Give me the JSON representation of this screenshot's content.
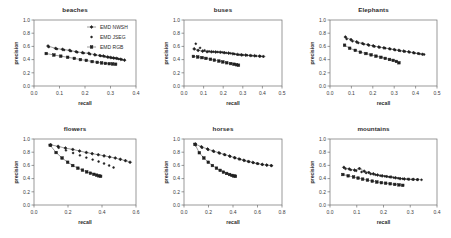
{
  "figure": {
    "layout": "2x3 grid of precision-recall plots",
    "rows": 2,
    "cols": 3,
    "axis_titles": {
      "x": "recall",
      "y": "precision"
    },
    "series_styles": [
      {
        "name": "EMD NWSH",
        "marker": "diamond",
        "line": true,
        "color": "#1f1f1f"
      },
      {
        "name": "EMD JSEG",
        "marker": "dot",
        "line": false,
        "color": "#1f1f1f"
      },
      {
        "name": "EMD RGB",
        "marker": "square",
        "line": true,
        "color": "#1f1f1f"
      }
    ],
    "legend": {
      "position": "top-right of first panel",
      "entries": [
        "EMD NWSH",
        "EMD JSEG",
        "EMD RGB"
      ]
    }
  },
  "chart_data": [
    {
      "type": "scatter",
      "title": "beaches",
      "xlabel": "recall",
      "ylabel": "precision",
      "xlim": [
        0.0,
        0.4
      ],
      "ylim": [
        0.0,
        1.0
      ],
      "xticks": [
        "0.0",
        "0.1",
        "0.2",
        "0.3",
        "0.4"
      ],
      "yticks": [
        "0.0",
        "0.2",
        "0.4",
        "0.6",
        "0.8",
        "1.0"
      ],
      "grid": false,
      "legend_position": "upper right",
      "series": [
        {
          "name": "EMD NWSH",
          "x": [
            0.055,
            0.085,
            0.112,
            0.14,
            0.165,
            0.19,
            0.215,
            0.238,
            0.258,
            0.272,
            0.288,
            0.3,
            0.312,
            0.325,
            0.34,
            0.355
          ],
          "y": [
            0.605,
            0.57,
            0.555,
            0.54,
            0.52,
            0.505,
            0.495,
            0.475,
            0.462,
            0.455,
            0.44,
            0.432,
            0.425,
            0.418,
            0.405,
            0.392
          ]
        },
        {
          "name": "EMD JSEG",
          "x": [
            0.058,
            0.09,
            0.118,
            0.145,
            0.17,
            0.195,
            0.22,
            0.242,
            0.262,
            0.278,
            0.292,
            0.305,
            0.318,
            0.332,
            0.345
          ],
          "y": [
            0.59,
            0.56,
            0.545,
            0.528,
            0.512,
            0.498,
            0.482,
            0.468,
            0.455,
            0.446,
            0.436,
            0.428,
            0.42,
            0.41,
            0.4
          ]
        },
        {
          "name": "EMD RGB",
          "x": [
            0.048,
            0.078,
            0.105,
            0.132,
            0.158,
            0.182,
            0.205,
            0.228,
            0.248,
            0.265,
            0.28,
            0.295,
            0.308,
            0.32
          ],
          "y": [
            0.492,
            0.47,
            0.452,
            0.435,
            0.418,
            0.4,
            0.388,
            0.37,
            0.358,
            0.35,
            0.342,
            0.338,
            0.334,
            0.33
          ]
        }
      ]
    },
    {
      "type": "scatter",
      "title": "buses",
      "xlabel": "recall",
      "ylabel": "precision",
      "xlim": [
        0.0,
        0.5
      ],
      "ylim": [
        0.0,
        1.0
      ],
      "xticks": [
        "0.0",
        "0.1",
        "0.2",
        "0.3",
        "0.4",
        "0.5"
      ],
      "yticks": [
        "0.0",
        "0.2",
        "0.4",
        "0.6",
        "0.8",
        "1.0"
      ],
      "grid": false,
      "legend_position": "none",
      "series": [
        {
          "name": "EMD NWSH",
          "x": [
            0.052,
            0.072,
            0.095,
            0.118,
            0.14,
            0.162,
            0.185,
            0.205,
            0.228,
            0.25,
            0.272,
            0.292,
            0.315,
            0.338,
            0.36,
            0.385,
            0.405
          ],
          "y": [
            0.562,
            0.54,
            0.528,
            0.52,
            0.518,
            0.515,
            0.512,
            0.505,
            0.498,
            0.488,
            0.478,
            0.472,
            0.468,
            0.462,
            0.458,
            0.452,
            0.448
          ]
        },
        {
          "name": "EMD JSEG",
          "x": [
            0.06,
            0.082,
            0.105,
            0.128,
            0.15,
            0.172,
            0.195,
            0.215,
            0.238,
            0.258,
            0.28,
            0.3,
            0.322,
            0.345,
            0.368,
            0.39
          ],
          "y": [
            0.64,
            0.578,
            0.54,
            0.525,
            0.52,
            0.515,
            0.51,
            0.502,
            0.495,
            0.485,
            0.475,
            0.47,
            0.465,
            0.46,
            0.455,
            0.45
          ]
        },
        {
          "name": "EMD RGB",
          "x": [
            0.048,
            0.07,
            0.092,
            0.112,
            0.135,
            0.155,
            0.178,
            0.198,
            0.218,
            0.238,
            0.255,
            0.268,
            0.278
          ],
          "y": [
            0.448,
            0.44,
            0.43,
            0.418,
            0.405,
            0.392,
            0.378,
            0.365,
            0.352,
            0.34,
            0.33,
            0.322,
            0.315
          ]
        }
      ]
    },
    {
      "type": "scatter",
      "title": "Elephants",
      "xlabel": "recall",
      "ylabel": "precision",
      "xlim": [
        0.0,
        0.5
      ],
      "ylim": [
        0.0,
        1.0
      ],
      "xticks": [
        "0.0",
        "0.1",
        "0.2",
        "0.3",
        "0.4",
        "0.5"
      ],
      "yticks": [
        "0.0",
        "0.2",
        "0.4",
        "0.6",
        "0.8",
        "1.0"
      ],
      "grid": false,
      "legend_position": "none",
      "series": [
        {
          "name": "EMD NWSH",
          "x": [
            0.072,
            0.098,
            0.125,
            0.152,
            0.178,
            0.202,
            0.228,
            0.252,
            0.278,
            0.3,
            0.322,
            0.345,
            0.368,
            0.39,
            0.412,
            0.432
          ],
          "y": [
            0.742,
            0.702,
            0.668,
            0.645,
            0.625,
            0.608,
            0.592,
            0.578,
            0.565,
            0.552,
            0.54,
            0.528,
            0.518,
            0.505,
            0.492,
            0.48
          ]
        },
        {
          "name": "EMD JSEG",
          "x": [
            0.078,
            0.105,
            0.132,
            0.158,
            0.182,
            0.208,
            0.232,
            0.258,
            0.282,
            0.305,
            0.328,
            0.35,
            0.372,
            0.395,
            0.418,
            0.44
          ],
          "y": [
            0.712,
            0.678,
            0.652,
            0.632,
            0.615,
            0.598,
            0.585,
            0.572,
            0.558,
            0.545,
            0.532,
            0.522,
            0.51,
            0.498,
            0.488,
            0.478
          ]
        },
        {
          "name": "EMD RGB",
          "x": [
            0.068,
            0.092,
            0.118,
            0.142,
            0.168,
            0.192,
            0.215,
            0.238,
            0.258,
            0.278,
            0.295,
            0.31,
            0.322
          ],
          "y": [
            0.618,
            0.572,
            0.54,
            0.512,
            0.492,
            0.472,
            0.452,
            0.435,
            0.418,
            0.402,
            0.388,
            0.372,
            0.352
          ]
        }
      ]
    },
    {
      "type": "scatter",
      "title": "flowers",
      "xlabel": "recall",
      "ylabel": "precision",
      "xlim": [
        0.0,
        0.6
      ],
      "ylim": [
        0.0,
        1.0
      ],
      "xticks": [
        "0.0",
        "0.2",
        "0.4",
        "0.6"
      ],
      "yticks": [
        "0.0",
        "0.2",
        "0.4",
        "0.6",
        "0.8",
        "1.0"
      ],
      "grid": false,
      "legend_position": "none",
      "series": [
        {
          "name": "EMD NWSH",
          "x": [
            0.098,
            0.142,
            0.185,
            0.228,
            0.268,
            0.308,
            0.342,
            0.378,
            0.412,
            0.445,
            0.478,
            0.508,
            0.538,
            0.565
          ],
          "y": [
            0.912,
            0.888,
            0.862,
            0.842,
            0.818,
            0.795,
            0.778,
            0.762,
            0.745,
            0.728,
            0.712,
            0.692,
            0.672,
            0.648
          ]
        },
        {
          "name": "EMD JSEG",
          "x": [
            0.1,
            0.145,
            0.188,
            0.23,
            0.27,
            0.308,
            0.345,
            0.38,
            0.412,
            0.442,
            0.468
          ],
          "y": [
            0.902,
            0.868,
            0.828,
            0.788,
            0.752,
            0.718,
            0.688,
            0.658,
            0.628,
            0.598,
            0.568
          ]
        },
        {
          "name": "EMD RGB",
          "x": [
            0.095,
            0.13,
            0.165,
            0.198,
            0.228,
            0.258,
            0.285,
            0.31,
            0.332,
            0.352,
            0.368,
            0.382,
            0.392
          ],
          "y": [
            0.905,
            0.795,
            0.712,
            0.648,
            0.598,
            0.558,
            0.528,
            0.502,
            0.482,
            0.465,
            0.452,
            0.442,
            0.435
          ]
        }
      ]
    },
    {
      "type": "scatter",
      "title": "horses",
      "xlabel": "recall",
      "ylabel": "precision",
      "xlim": [
        0.0,
        0.8
      ],
      "ylim": [
        0.0,
        1.0
      ],
      "xticks": [
        "0.0",
        "0.2",
        "0.4",
        "0.6",
        "0.8"
      ],
      "yticks": [
        "0.0",
        "0.2",
        "0.4",
        "0.6",
        "0.8",
        "1.0"
      ],
      "grid": false,
      "legend_position": "none",
      "series": [
        {
          "name": "EMD NWSH",
          "x": [
            0.092,
            0.142,
            0.192,
            0.238,
            0.285,
            0.33,
            0.372,
            0.412,
            0.45,
            0.488,
            0.525,
            0.562,
            0.598,
            0.638,
            0.675,
            0.712
          ],
          "y": [
            0.925,
            0.882,
            0.848,
            0.818,
            0.792,
            0.765,
            0.742,
            0.718,
            0.698,
            0.678,
            0.66,
            0.645,
            0.628,
            0.615,
            0.605,
            0.598
          ]
        },
        {
          "name": "EMD JSEG",
          "x": [
            0.095,
            0.148,
            0.198,
            0.245,
            0.292,
            0.335,
            0.378,
            0.418,
            0.458,
            0.495,
            0.532,
            0.568,
            0.605,
            0.642,
            0.678,
            0.715
          ],
          "y": [
            0.905,
            0.868,
            0.838,
            0.808,
            0.782,
            0.758,
            0.735,
            0.712,
            0.692,
            0.672,
            0.655,
            0.64,
            0.625,
            0.612,
            0.602,
            0.595
          ]
        },
        {
          "name": "EMD RGB",
          "x": [
            0.09,
            0.125,
            0.162,
            0.198,
            0.232,
            0.265,
            0.295,
            0.322,
            0.348,
            0.372,
            0.392,
            0.408,
            0.42
          ],
          "y": [
            0.918,
            0.792,
            0.712,
            0.648,
            0.598,
            0.558,
            0.525,
            0.498,
            0.478,
            0.462,
            0.448,
            0.44,
            0.435
          ]
        }
      ]
    },
    {
      "type": "scatter",
      "title": "mountains",
      "xlabel": "recall",
      "ylabel": "precision",
      "xlim": [
        0.0,
        0.4
      ],
      "ylim": [
        0.0,
        1.0
      ],
      "xticks": [
        "0.0",
        "0.1",
        "0.2",
        "0.3",
        "0.4"
      ],
      "yticks": [
        "0.0",
        "0.2",
        "0.4",
        "0.6",
        "0.8",
        "1.0"
      ],
      "grid": false,
      "legend_position": "none",
      "series": [
        {
          "name": "EMD NWSH",
          "x": [
            0.052,
            0.072,
            0.092,
            0.11,
            0.128,
            0.145,
            0.162,
            0.178,
            0.195,
            0.212,
            0.228,
            0.245,
            0.262,
            0.278,
            0.295,
            0.312,
            0.328
          ],
          "y": [
            0.57,
            0.545,
            0.528,
            0.552,
            0.512,
            0.492,
            0.472,
            0.455,
            0.442,
            0.432,
            0.425,
            0.412,
            0.4,
            0.395,
            0.39,
            0.388,
            0.385
          ]
        },
        {
          "name": "EMD JSEG",
          "x": [
            0.058,
            0.078,
            0.098,
            0.118,
            0.135,
            0.152,
            0.17,
            0.188,
            0.205,
            0.222,
            0.238,
            0.255,
            0.272,
            0.29,
            0.308,
            0.325,
            0.342
          ],
          "y": [
            0.548,
            0.532,
            0.518,
            0.5,
            0.485,
            0.47,
            0.458,
            0.445,
            0.435,
            0.425,
            0.415,
            0.405,
            0.398,
            0.392,
            0.388,
            0.385,
            0.382
          ]
        },
        {
          "name": "EMD RGB",
          "x": [
            0.048,
            0.068,
            0.088,
            0.105,
            0.122,
            0.14,
            0.158,
            0.175,
            0.192,
            0.208,
            0.225,
            0.242,
            0.258,
            0.272
          ],
          "y": [
            0.462,
            0.442,
            0.425,
            0.408,
            0.392,
            0.378,
            0.362,
            0.348,
            0.338,
            0.33,
            0.322,
            0.312,
            0.305,
            0.298
          ]
        }
      ]
    }
  ]
}
